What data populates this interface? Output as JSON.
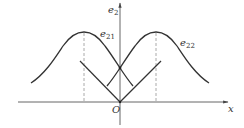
{
  "diagram": {
    "axes": {
      "x_label": "x",
      "y_label_main": "e",
      "y_label_sub": "2",
      "origin_label": "O"
    },
    "curves": [
      {
        "id": "e21",
        "label_main": "e",
        "label_sub": "21"
      },
      {
        "id": "e22",
        "label_main": "e",
        "label_sub": "22"
      }
    ],
    "colors": {
      "curve": "#333333",
      "axis": "#555555",
      "dashed": "#aaaaaa"
    }
  }
}
